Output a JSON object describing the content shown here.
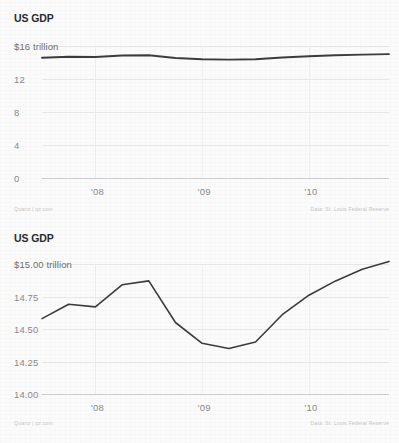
{
  "charts": [
    {
      "id": "chart-top",
      "title": "US GDP",
      "unit_label": "$16 trillion",
      "footer_left": "Quartz | qz.com",
      "footer_right": "Data: St. Louis Federal Reserve",
      "chart_data": {
        "type": "line",
        "title": "US GDP",
        "xlabel": "",
        "ylabel": "$16 trillion",
        "ylim": [
          0,
          16
        ],
        "yticks": [
          16,
          12,
          8,
          4,
          0
        ],
        "ytick_labels": [
          "$16 trillion",
          "12",
          "8",
          "4",
          "0"
        ],
        "grid": true,
        "legend": "none",
        "x": [
          "2007 Q3",
          "2007 Q4",
          "2008 Q1",
          "2008 Q2",
          "2008 Q3",
          "2008 Q4",
          "2009 Q1",
          "2009 Q2",
          "2009 Q3",
          "2009 Q4",
          "2010 Q1",
          "2010 Q2",
          "2010 Q3",
          "2010 Q4"
        ],
        "xticks": [
          "'08",
          "'09",
          "'10"
        ],
        "values": [
          14.58,
          14.69,
          14.67,
          14.84,
          14.87,
          14.55,
          14.39,
          14.35,
          14.4,
          14.61,
          14.76,
          14.87,
          14.96,
          15.02
        ]
      }
    },
    {
      "id": "chart-bottom",
      "title": "US GDP",
      "unit_label": "$15.00 trillion",
      "footer_left": "Quartz | qz.com",
      "footer_right": "Data: St. Louis Federal Reserve",
      "chart_data": {
        "type": "line",
        "title": "US GDP",
        "xlabel": "",
        "ylabel": "$15.00 trillion",
        "ylim": [
          14.0,
          15.0
        ],
        "yticks": [
          15.0,
          14.75,
          14.5,
          14.25,
          14.0
        ],
        "ytick_labels": [
          "$15.00 trillion",
          "14.75",
          "14.50",
          "14.25",
          "14.00"
        ],
        "grid": true,
        "legend": "none",
        "x": [
          "2007 Q3",
          "2007 Q4",
          "2008 Q1",
          "2008 Q2",
          "2008 Q3",
          "2008 Q4",
          "2009 Q1",
          "2009 Q2",
          "2009 Q3",
          "2009 Q4",
          "2010 Q1",
          "2010 Q2",
          "2010 Q3",
          "2010 Q4"
        ],
        "xticks": [
          "'08",
          "'09",
          "'10"
        ],
        "values": [
          14.58,
          14.69,
          14.67,
          14.84,
          14.87,
          14.55,
          14.39,
          14.35,
          14.4,
          14.61,
          14.76,
          14.87,
          14.96,
          15.02
        ]
      }
    }
  ],
  "colors": {
    "line": "#3c3c3c",
    "grid": "#e8e8e8",
    "text_muted": "#8a8a8a",
    "title": "#2b2b2b",
    "background": "#fbfbfb"
  }
}
